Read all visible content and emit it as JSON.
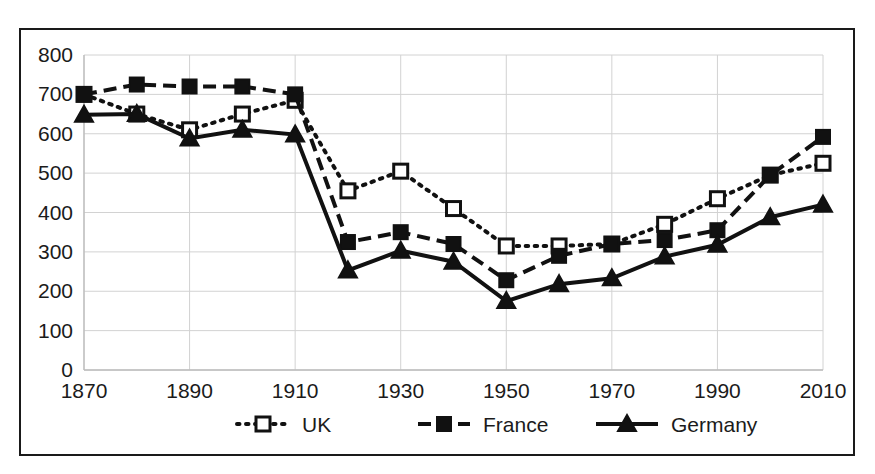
{
  "figure": {
    "title": "",
    "background_color": "#ffffff",
    "frame_color": "#1a1a1a"
  },
  "axes": {
    "y_ticks": [
      "0",
      "100",
      "200",
      "300",
      "400",
      "500",
      "600",
      "700",
      "800"
    ],
    "x_ticks": [
      "1870",
      "1890",
      "1910",
      "1930",
      "1950",
      "1970",
      "1990",
      "2010"
    ],
    "y_label": "",
    "x_label": ""
  },
  "legend": {
    "position": "bottom-center",
    "entries": [
      {
        "label": "UK",
        "style": "dotted",
        "marker": "open-square",
        "color": "#111111"
      },
      {
        "label": "France",
        "style": "dashed",
        "marker": "filled-square",
        "color": "#111111"
      },
      {
        "label": "Germany",
        "style": "solid",
        "marker": "filled-triangle",
        "color": "#111111"
      }
    ]
  },
  "chart_data": {
    "type": "line",
    "title": "",
    "subtitle": "",
    "xlabel": "",
    "ylabel": "",
    "xlim": [
      1870,
      2010
    ],
    "ylim": [
      0,
      800
    ],
    "y_tick_step": 100,
    "x_tick_step": 20,
    "grid": true,
    "legend_position": "bottom-center",
    "x": [
      1870,
      1880,
      1890,
      1900,
      1910,
      1920,
      1930,
      1940,
      1950,
      1960,
      1970,
      1980,
      1990,
      2000,
      2010
    ],
    "x_tick_values": [
      1870,
      1890,
      1910,
      1930,
      1950,
      1970,
      1990,
      2010
    ],
    "y_tick_values": [
      0,
      100,
      200,
      300,
      400,
      500,
      600,
      700,
      800
    ],
    "series": [
      {
        "name": "UK",
        "marker": "open-square",
        "linestyle": "dotted",
        "color": "#111111",
        "values": [
          700,
          650,
          610,
          650,
          685,
          455,
          505,
          410,
          315,
          315,
          320,
          370,
          435,
          495,
          525
        ]
      },
      {
        "name": "France",
        "marker": "filled-square",
        "linestyle": "dashed",
        "color": "#111111",
        "values": [
          700,
          725,
          720,
          720,
          700,
          325,
          350,
          320,
          228,
          290,
          320,
          330,
          355,
          495,
          592
        ]
      },
      {
        "name": "Germany",
        "marker": "filled-triangle",
        "linestyle": "solid",
        "color": "#111111",
        "values": [
          648,
          650,
          588,
          610,
          598,
          253,
          303,
          275,
          175,
          218,
          233,
          288,
          318,
          388,
          420
        ]
      }
    ]
  }
}
